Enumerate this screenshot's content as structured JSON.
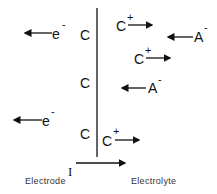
{
  "diagram": {
    "electrode_side": {
      "charges": [
        "C",
        "C",
        "C"
      ],
      "electrons": [
        {
          "label": "e",
          "charge": "-"
        },
        {
          "label": "e",
          "charge": "-"
        }
      ]
    },
    "electrolyte_side": {
      "cations": [
        {
          "label": "C",
          "charge": "+"
        },
        {
          "label": "C",
          "charge": "+"
        },
        {
          "label": "C",
          "charge": "+"
        }
      ],
      "anions": [
        {
          "label": "A",
          "charge": "-"
        },
        {
          "label": "A",
          "charge": "-"
        }
      ]
    },
    "current_label": "I",
    "labels": {
      "electrode": "Electrode",
      "electrolyte": "Electrolyte"
    },
    "colors": {
      "line": "#111111",
      "text": "#111111",
      "caption": "#333333"
    }
  }
}
